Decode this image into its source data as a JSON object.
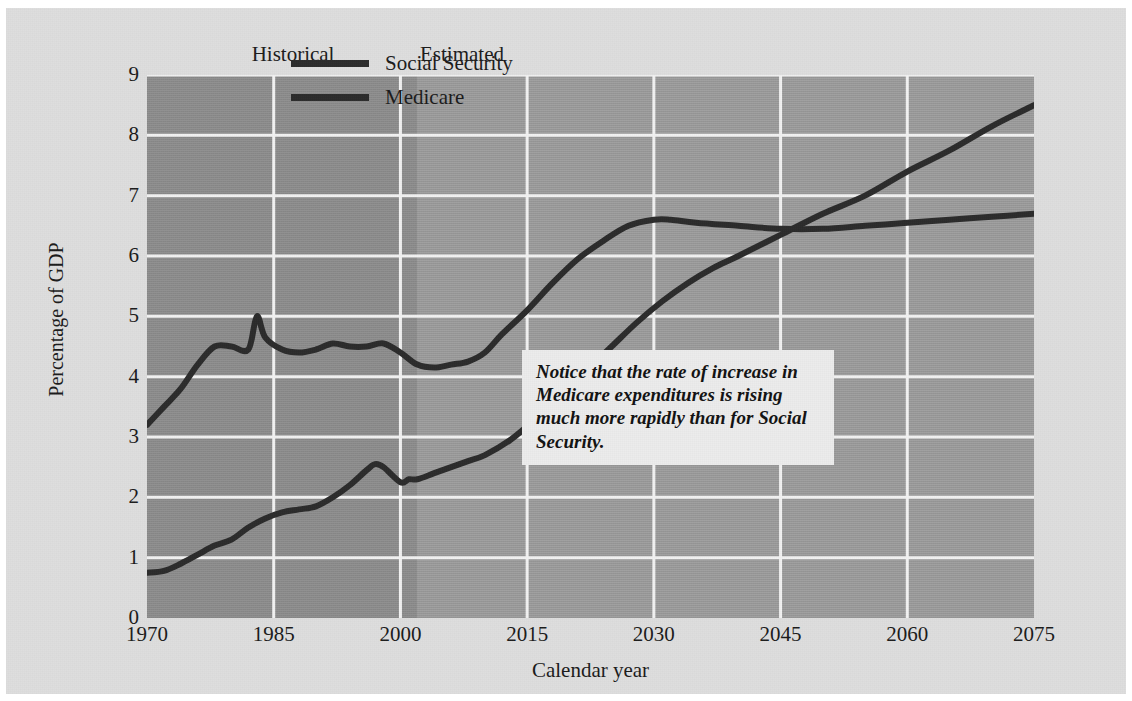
{
  "chart_data": {
    "type": "line",
    "title": "",
    "xlabel": "Calendar year",
    "ylabel": "Percentage of GDP",
    "xlim": [
      1970,
      2075
    ],
    "ylim": [
      0,
      9
    ],
    "xticks": [
      1970,
      1985,
      2000,
      2015,
      2030,
      2045,
      2060,
      2075
    ],
    "yticks": [
      0,
      1,
      2,
      3,
      4,
      5,
      6,
      7,
      8,
      9
    ],
    "grid": true,
    "legend_position": "top-center",
    "period_labels": [
      {
        "text": "Historical",
        "year": 1988
      },
      {
        "text": "Estimated",
        "year": 2008
      }
    ],
    "historical_end_year": 2002,
    "annotation": "Notice that the rate of increase in Medicare expenditures is rising much more rapidly than for Social Security.",
    "series": [
      {
        "name": "Social Security",
        "color": "#2b2b2b",
        "x": [
          1970,
          1972,
          1974,
          1976,
          1978,
          1980,
          1982,
          1983,
          1984,
          1986,
          1988,
          1990,
          1992,
          1994,
          1996,
          1998,
          2000,
          2002,
          2004,
          2006,
          2008,
          2010,
          2012,
          2015,
          2018,
          2021,
          2024,
          2027,
          2030,
          2032,
          2035,
          2040,
          2045,
          2050,
          2055,
          2060,
          2065,
          2070,
          2075
        ],
        "y": [
          3.2,
          3.5,
          3.8,
          4.2,
          4.5,
          4.5,
          4.45,
          5.0,
          4.65,
          4.45,
          4.4,
          4.45,
          4.55,
          4.5,
          4.5,
          4.55,
          4.4,
          4.2,
          4.15,
          4.2,
          4.25,
          4.4,
          4.7,
          5.1,
          5.55,
          5.95,
          6.25,
          6.5,
          6.6,
          6.6,
          6.55,
          6.5,
          6.45,
          6.45,
          6.5,
          6.55,
          6.6,
          6.65,
          6.7
        ]
      },
      {
        "name": "Medicare",
        "color": "#2b2b2b",
        "x": [
          1970,
          1972,
          1974,
          1976,
          1978,
          1980,
          1982,
          1984,
          1986,
          1988,
          1990,
          1992,
          1994,
          1996,
          1997,
          1998,
          2000,
          2001,
          2002,
          2004,
          2006,
          2008,
          2010,
          2013,
          2016,
          2019,
          2022,
          2025,
          2028,
          2031,
          2034,
          2037,
          2040,
          2045,
          2050,
          2055,
          2060,
          2065,
          2070,
          2075
        ],
        "y": [
          0.75,
          0.78,
          0.9,
          1.05,
          1.2,
          1.3,
          1.5,
          1.65,
          1.75,
          1.8,
          1.85,
          2.0,
          2.2,
          2.45,
          2.55,
          2.5,
          2.25,
          2.3,
          2.3,
          2.4,
          2.5,
          2.6,
          2.7,
          2.95,
          3.3,
          3.7,
          4.1,
          4.5,
          4.9,
          5.25,
          5.55,
          5.8,
          6.0,
          6.35,
          6.7,
          7.0,
          7.4,
          7.75,
          8.15,
          8.5
        ]
      }
    ]
  }
}
